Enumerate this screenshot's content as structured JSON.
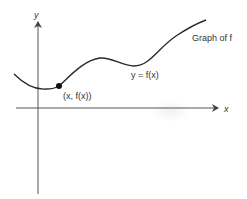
{
  "diagram": {
    "axes": {
      "x_label": "x",
      "y_label": "y"
    },
    "curve": {
      "name": "f",
      "equation_label": "y = f(x)",
      "caption": "Graph of f",
      "color": "#2a2a2a"
    },
    "point": {
      "label": "(x, f(x))",
      "color": "#111111"
    }
  }
}
